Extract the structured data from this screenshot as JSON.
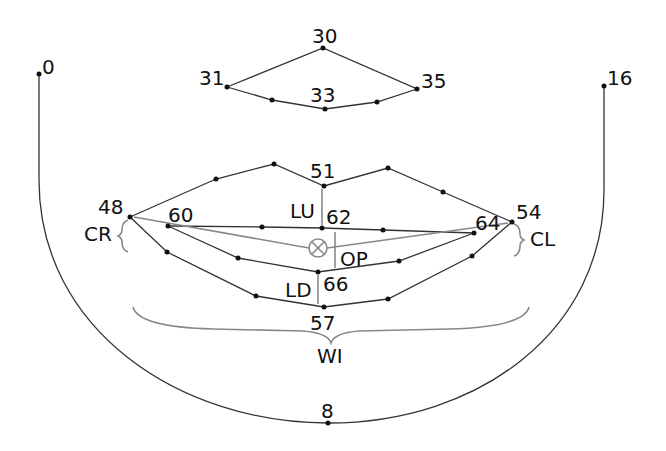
{
  "labels": {
    "p0": "0",
    "p16": "16",
    "p8": "8",
    "p30": "30",
    "p31": "31",
    "p33": "33",
    "p35": "35",
    "p48": "48",
    "p51": "51",
    "p54": "54",
    "p57": "57",
    "p60": "60",
    "p62": "62",
    "p64": "64",
    "p66": "66",
    "CR": "CR",
    "CL": "CL",
    "LU": "LU",
    "LD": "LD",
    "OP": "OP",
    "WI": "WI"
  },
  "colors": {
    "line": "#333333",
    "measure": "#888888"
  }
}
